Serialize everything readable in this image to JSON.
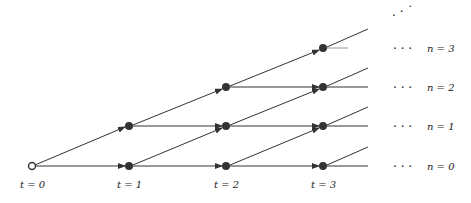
{
  "diagram": {
    "type": "lattice-state-transition",
    "time_labels": [
      "t = 0",
      "t = 1",
      "t = 2",
      "t = 3"
    ],
    "state_labels": [
      "n = 0",
      "n = 1",
      "n = 2",
      "n = 3"
    ],
    "continuation": "· · ·",
    "colors": {
      "line": "#333333",
      "node": "#333333",
      "start_node_fill": "#ffffff"
    }
  }
}
